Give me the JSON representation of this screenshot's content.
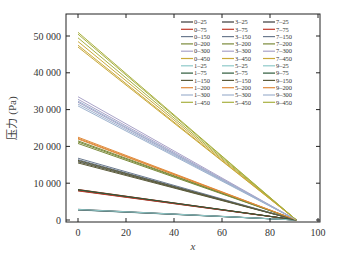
{
  "chart_data": {
    "type": "line",
    "title": "",
    "xlabel": "x",
    "ylabel": "压力 (Pa)",
    "xlim": [
      -5,
      100
    ],
    "ylim": [
      -1000,
      53000
    ],
    "xticks": [
      0,
      20,
      40,
      60,
      80,
      100
    ],
    "xtick_labels": [
      "0",
      "20",
      "40",
      "60",
      "80",
      "100"
    ],
    "yticks": [
      0,
      10000,
      20000,
      30000,
      40000,
      50000
    ],
    "ytick_labels": [
      "0",
      "10 000",
      "20 000",
      "30 000",
      "40 000",
      "50 000"
    ],
    "grid": false,
    "legend_position": "upper right",
    "legend_columns": 3,
    "x": [
      0,
      91
    ],
    "series": [
      {
        "name": "0–25",
        "color": "#3a3a3a",
        "values": [
          2800,
          0
        ]
      },
      {
        "name": "0–75",
        "color": "#c0392b",
        "values": [
          8200,
          0
        ]
      },
      {
        "name": "0–150",
        "color": "#6b7a8f",
        "values": [
          16000,
          0
        ]
      },
      {
        "name": "0–200",
        "color": "#7a8a3a",
        "values": [
          21500,
          0
        ]
      },
      {
        "name": "0–300",
        "color": "#a9a3c8",
        "values": [
          32000,
          0
        ]
      },
      {
        "name": "0–450",
        "color": "#c9a93a",
        "values": [
          48500,
          0
        ]
      },
      {
        "name": "1–25",
        "color": "#8fc9c9",
        "values": [
          2700,
          0
        ]
      },
      {
        "name": "1–75",
        "color": "#2d5a3a",
        "values": [
          8000,
          0
        ]
      },
      {
        "name": "1–150",
        "color": "#5a5a3a",
        "values": [
          15800,
          0
        ]
      },
      {
        "name": "1–200",
        "color": "#e08a3a",
        "values": [
          22000,
          0
        ]
      },
      {
        "name": "1–300",
        "color": "#9fb3cf",
        "values": [
          31500,
          0
        ]
      },
      {
        "name": "1–450",
        "color": "#a8b040",
        "values": [
          49500,
          0
        ]
      },
      {
        "name": "3–25",
        "color": "#3a3a3a",
        "values": [
          2900,
          0
        ]
      },
      {
        "name": "3–75",
        "color": "#c0392b",
        "values": [
          8300,
          0
        ]
      },
      {
        "name": "3–150",
        "color": "#6b7a8f",
        "values": [
          16400,
          0
        ]
      },
      {
        "name": "3–200",
        "color": "#7a8a3a",
        "values": [
          21200,
          0
        ]
      },
      {
        "name": "3–300",
        "color": "#a9a3c8",
        "values": [
          32800,
          0
        ]
      },
      {
        "name": "3–450",
        "color": "#c9a93a",
        "values": [
          47500,
          0
        ]
      },
      {
        "name": "5–25",
        "color": "#8fc9c9",
        "values": [
          2800,
          0
        ]
      },
      {
        "name": "5–75",
        "color": "#2d5a3a",
        "values": [
          8100,
          0
        ]
      },
      {
        "name": "5–150",
        "color": "#5a5a3a",
        "values": [
          15500,
          0
        ]
      },
      {
        "name": "5–200",
        "color": "#e08a3a",
        "values": [
          22500,
          0
        ]
      },
      {
        "name": "5–300",
        "color": "#9fb3cf",
        "values": [
          31000,
          0
        ]
      },
      {
        "name": "5–450",
        "color": "#a8b040",
        "values": [
          50500,
          0
        ]
      },
      {
        "name": "7–25",
        "color": "#3a3a3a",
        "values": [
          2750,
          0
        ]
      },
      {
        "name": "7–75",
        "color": "#c0392b",
        "values": [
          7900,
          0
        ]
      },
      {
        "name": "7–150",
        "color": "#6b7a8f",
        "values": [
          16800,
          0
        ]
      },
      {
        "name": "7–200",
        "color": "#7a8a3a",
        "values": [
          20800,
          0
        ]
      },
      {
        "name": "7–300",
        "color": "#a9a3c8",
        "values": [
          33500,
          0
        ]
      },
      {
        "name": "7–450",
        "color": "#c9a93a",
        "values": [
          47000,
          0
        ]
      },
      {
        "name": "9–25",
        "color": "#8fc9c9",
        "values": [
          2850,
          0
        ]
      },
      {
        "name": "9–75",
        "color": "#2d5a3a",
        "values": [
          8250,
          0
        ]
      },
      {
        "name": "9–150",
        "color": "#5a5a3a",
        "values": [
          16200,
          0
        ]
      },
      {
        "name": "9–200",
        "color": "#e08a3a",
        "values": [
          22200,
          0
        ]
      },
      {
        "name": "9–300",
        "color": "#9fb3cf",
        "values": [
          32300,
          0
        ]
      },
      {
        "name": "9–450",
        "color": "#a8b040",
        "values": [
          51000,
          0
        ]
      }
    ]
  }
}
